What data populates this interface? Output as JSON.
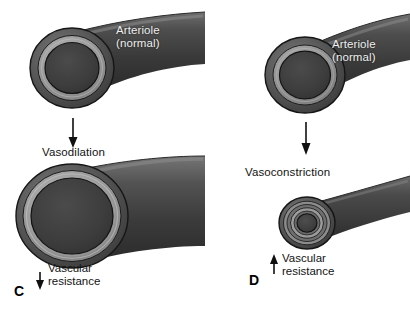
{
  "figure": {
    "title_visible": false,
    "background": "#ffffff",
    "ink": "#131313"
  },
  "panels": [
    {
      "letter": "C",
      "process_label": "Vasodilation",
      "vessel_top_label": "Arteriole\n(normal)",
      "resistance_label": "Vascular\nresistance",
      "resistance_direction": "down",
      "resistance_arrow_glyph": "↓"
    },
    {
      "letter": "D",
      "process_label": "Vasoconstriction",
      "vessel_top_label": "Arteriole\n(normal)",
      "resistance_label": "Vascular\nresistance",
      "resistance_direction": "up",
      "resistance_arrow_glyph": "↑"
    }
  ],
  "colors": {
    "wall_outer_dark": "#3c3c3c",
    "wall_outer_mid": "#4a4a4a",
    "wall_ring_light": "#8e8e8e",
    "wall_ring_lighter": "#a3a3a3",
    "lumen_dark": "#3a3a3a",
    "lumen_darker": "#333333",
    "outline": "#141414",
    "arrow": "#101010",
    "text": "#131313",
    "white_text": "#efefef"
  }
}
